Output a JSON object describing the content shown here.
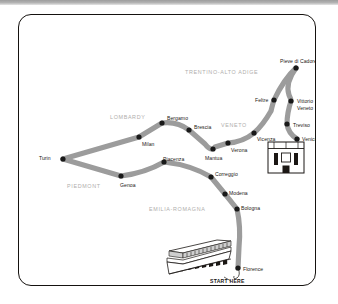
{
  "map": {
    "title": "Italy road trip route map",
    "colors": {
      "route": "#9c9c9c",
      "marker": "#191919",
      "frame": "#15120f",
      "region_text": "#b0aeac",
      "city_text": "#1b1714",
      "background": "#ffffff",
      "top_bar": "#a8a8a8"
    },
    "start_label": "START HERE",
    "regions": [
      {
        "name": "TRENTINO-ALTO ADIGE",
        "x": 166,
        "y": 55
      },
      {
        "name": "LOMBARDY",
        "x": 91,
        "y": 100
      },
      {
        "name": "VENETO",
        "x": 202,
        "y": 108
      },
      {
        "name": "PIEDMONT",
        "x": 48,
        "y": 169
      },
      {
        "name": "EMILIA-ROMAGNA",
        "x": 130,
        "y": 192
      },
      {
        "name": "TUSCANY",
        "x": 229,
        "y": 272
      }
    ],
    "cities": [
      {
        "name": "Turin",
        "x": 44,
        "y": 144,
        "lx": 20,
        "ly": 141
      },
      {
        "name": "Genoa",
        "x": 102,
        "y": 161,
        "lx": 101,
        "ly": 168
      },
      {
        "name": "Milan",
        "x": 120,
        "y": 122,
        "lx": 123,
        "ly": 127
      },
      {
        "name": "Bergamo",
        "x": 143,
        "y": 108,
        "lx": 148,
        "ly": 101
      },
      {
        "name": "Brescia",
        "x": 170,
        "y": 115,
        "lx": 175,
        "ly": 110
      },
      {
        "name": "Piacenza",
        "x": 145,
        "y": 147,
        "lx": 144,
        "ly": 142
      },
      {
        "name": "Mantua",
        "x": 194,
        "y": 134,
        "lx": 186,
        "ly": 141
      },
      {
        "name": "Verona",
        "x": 209,
        "y": 128,
        "lx": 212,
        "ly": 133
      },
      {
        "name": "Vicenza",
        "x": 235,
        "y": 118,
        "lx": 238,
        "ly": 122
      },
      {
        "name": "Feltre",
        "x": 255,
        "y": 85,
        "lx": 236,
        "ly": 83
      },
      {
        "name": "Pieve di Cadore",
        "x": 277,
        "y": 53,
        "lx": 261,
        "ly": 44
      },
      {
        "name": "Vittorio Veneto",
        "x": 272,
        "y": 86,
        "lx": 278,
        "ly": 83
      },
      {
        "name": "Treviso",
        "x": 268,
        "y": 109,
        "lx": 274,
        "ly": 108
      },
      {
        "name": "Venice",
        "x": 278,
        "y": 124,
        "lx": 283,
        "ly": 122
      },
      {
        "name": "Correggio",
        "x": 192,
        "y": 162,
        "lx": 196,
        "ly": 157
      },
      {
        "name": "Modena",
        "x": 206,
        "y": 179,
        "lx": 210,
        "ly": 176
      },
      {
        "name": "Bologna",
        "x": 218,
        "y": 194,
        "lx": 222,
        "ly": 191
      },
      {
        "name": "Florence",
        "x": 219,
        "y": 253,
        "lx": 224,
        "ly": 252
      }
    ],
    "landmarks": [
      {
        "name": "venice-building-icon",
        "x": 267,
        "y": 136
      },
      {
        "name": "florence-colonnade-icon",
        "x": 166,
        "y": 228
      }
    ]
  }
}
